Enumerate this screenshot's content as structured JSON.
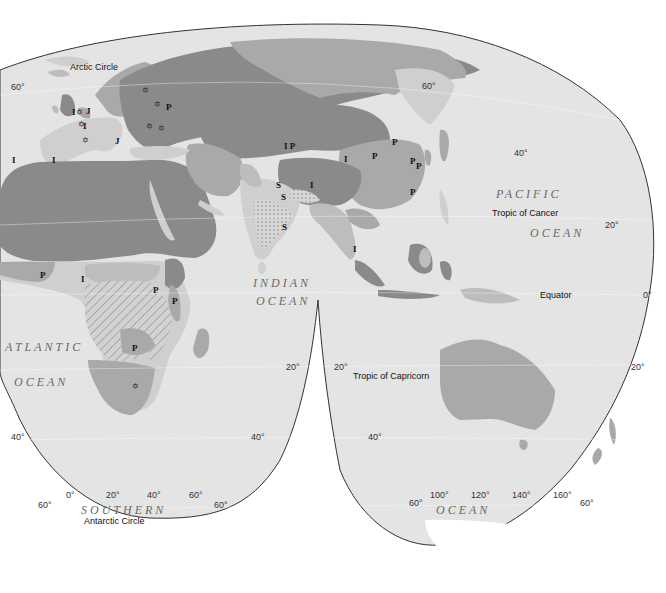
{
  "colors": {
    "background": "#ffffff",
    "ocean": "#e4e4e4",
    "land_light": "#cfcfcf",
    "region_dark": "#8a8a8a",
    "region_medium": "#a9a9a9",
    "region_light": "#bdbdbd",
    "outline": "#333333",
    "antarctica": "#ffffff"
  },
  "circle_labels": {
    "arctic": "Arctic Circle",
    "tropic_cancer": "Tropic of Cancer",
    "equator": "Equator",
    "tropic_capricorn": "Tropic of Capricorn",
    "antarctic": "Antarctic Circle"
  },
  "oceans": {
    "pacific_1": "PACIFIC",
    "pacific_2": "OCEAN",
    "indian_1": "INDIAN",
    "indian_2": "OCEAN",
    "atlantic_1": "ATLANTIC",
    "atlantic_2": "OCEAN",
    "southern_1": "SOUTHERN",
    "southern_2": "OCEAN"
  },
  "latitude_labels": {
    "nw_60": "60°",
    "ne_60": "60°",
    "e_40": "40°",
    "e_20": "20°",
    "e_0": "0°",
    "e_20s": "20°",
    "mid_left_20": "20°",
    "mid_right_20": "20°",
    "sw_40": "40°",
    "mid_left_40": "40°",
    "mid_right_40": "40°",
    "sw_60": "60°",
    "mid_left_60": "60°",
    "mid_right_60": "60°",
    "se_60": "60°"
  },
  "longitude_labels": {
    "lon_0": "0°",
    "lon_20": "20°",
    "lon_40": "40°",
    "lon_60": "60°",
    "lon_100": "100°",
    "lon_120": "120°",
    "lon_140": "140°",
    "lon_160": "160°"
  },
  "region_symbols": {
    "I": "I",
    "P": "P",
    "S": "S",
    "J": "J",
    "IP": "I P"
  },
  "star_symbol": "✡"
}
